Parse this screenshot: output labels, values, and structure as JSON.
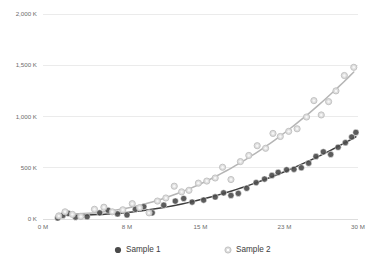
{
  "chart_data": {
    "type": "scatter",
    "title": "",
    "subtitle": "",
    "xlabel": "",
    "ylabel": "",
    "xlim": [
      0,
      30
    ],
    "ylim": [
      0,
      2000
    ],
    "x_unit": "M",
    "y_unit": "K",
    "grid": true,
    "grid_axis": "y",
    "legend_position": "bottom",
    "x_ticks": [
      0,
      8,
      15,
      23,
      30
    ],
    "x_tick_labels": [
      "0 M",
      "8 M",
      "15 M",
      "23 M",
      "30 M"
    ],
    "y_ticks": [
      0,
      500,
      1000,
      1500,
      2000
    ],
    "y_tick_labels": [
      "0 K",
      "500 K",
      "1,000 K",
      "1,500 K",
      "2,000 K"
    ],
    "series": [
      {
        "name": "Sample 1",
        "color": "#4a4a4a",
        "marker": "filled-circle",
        "trendline": true,
        "trendline_color": "#3d3d3d",
        "points": [
          [
            1.4,
            10
          ],
          [
            1.9,
            35
          ],
          [
            2.4,
            55
          ],
          [
            3.1,
            18
          ],
          [
            4.2,
            22
          ],
          [
            5.4,
            60
          ],
          [
            6.2,
            85
          ],
          [
            7.1,
            50
          ],
          [
            8.0,
            40
          ],
          [
            8.8,
            95
          ],
          [
            9.6,
            120
          ],
          [
            10.4,
            60
          ],
          [
            11.5,
            135
          ],
          [
            12.6,
            175
          ],
          [
            13.4,
            200
          ],
          [
            14.2,
            165
          ],
          [
            15.3,
            185
          ],
          [
            16.4,
            215
          ],
          [
            17.2,
            255
          ],
          [
            17.9,
            230
          ],
          [
            18.6,
            250
          ],
          [
            19.4,
            300
          ],
          [
            20.3,
            355
          ],
          [
            21.1,
            390
          ],
          [
            21.8,
            425
          ],
          [
            22.4,
            455
          ],
          [
            23.2,
            480
          ],
          [
            23.9,
            485
          ],
          [
            24.6,
            500
          ],
          [
            25.3,
            545
          ],
          [
            26.0,
            610
          ],
          [
            26.7,
            655
          ],
          [
            27.4,
            630
          ],
          [
            28.1,
            700
          ],
          [
            28.8,
            745
          ],
          [
            29.4,
            800
          ],
          [
            29.8,
            845
          ]
        ]
      },
      {
        "name": "Sample 2",
        "color": "#c9c9c9",
        "marker": "open-circle",
        "trendline": true,
        "trendline_color": "#b5b5b5",
        "points": [
          [
            1.5,
            30
          ],
          [
            2.1,
            70
          ],
          [
            2.8,
            45
          ],
          [
            3.6,
            25
          ],
          [
            4.9,
            95
          ],
          [
            5.8,
            115
          ],
          [
            6.6,
            70
          ],
          [
            7.6,
            90
          ],
          [
            8.5,
            150
          ],
          [
            9.2,
            110
          ],
          [
            10.1,
            60
          ],
          [
            10.9,
            175
          ],
          [
            11.7,
            205
          ],
          [
            12.5,
            320
          ],
          [
            13.2,
            265
          ],
          [
            13.9,
            280
          ],
          [
            14.8,
            350
          ],
          [
            15.6,
            370
          ],
          [
            16.4,
            400
          ],
          [
            17.1,
            505
          ],
          [
            17.9,
            385
          ],
          [
            18.8,
            560
          ],
          [
            19.6,
            620
          ],
          [
            20.4,
            715
          ],
          [
            21.2,
            690
          ],
          [
            21.9,
            835
          ],
          [
            22.6,
            805
          ],
          [
            23.4,
            855
          ],
          [
            24.2,
            880
          ],
          [
            25.1,
            995
          ],
          [
            25.8,
            1155
          ],
          [
            26.5,
            1015
          ],
          [
            27.2,
            1145
          ],
          [
            27.9,
            1250
          ],
          [
            28.7,
            1400
          ],
          [
            29.6,
            1480
          ]
        ]
      }
    ]
  },
  "legend": {
    "items": [
      {
        "label": "Sample 1"
      },
      {
        "label": "Sample 2"
      }
    ]
  }
}
